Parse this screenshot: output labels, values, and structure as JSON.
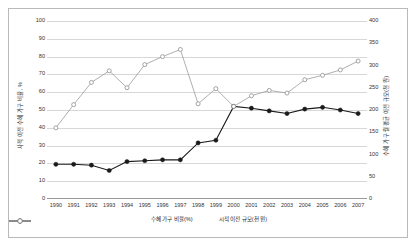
{
  "chart_data": {
    "type": "line",
    "title": "",
    "xlabel": "",
    "ylabel_left": "사적 이전 수혜 가구 비율, %",
    "ylabel_right": "수혜 가구 월평균 이전 규모(천 원)",
    "categories": [
      "1990",
      "1991",
      "1992",
      "1993",
      "1994",
      "1995",
      "1996",
      "1997",
      "1998",
      "1999",
      "2000",
      "2001",
      "2002",
      "2003",
      "2004",
      "2005",
      "2006",
      "2007"
    ],
    "ylim_left": [
      0,
      100
    ],
    "ylim_right": [
      0,
      400
    ],
    "yticks_left": [
      0,
      10,
      20,
      30,
      40,
      50,
      60,
      70,
      80,
      90,
      100
    ],
    "yticks_right": [
      0,
      50,
      100,
      150,
      200,
      250,
      300,
      350,
      400
    ],
    "grid": true,
    "legend_position": "bottom",
    "series": [
      {
        "name": "수혜 가구 비율(%)",
        "axis": "left",
        "marker": "filled-circle",
        "color": "#1a1a1a",
        "values": [
          19.5,
          19.5,
          19.0,
          16.0,
          21.0,
          21.5,
          22.0,
          22.0,
          31.5,
          33.0,
          52.0,
          51.0,
          49.5,
          48.0,
          50.5,
          51.5,
          50.0,
          48.0
        ]
      },
      {
        "name": "시적 이전 규모(천 원)",
        "axis": "right",
        "marker": "open-circle",
        "color": "#9a9a9a",
        "values": [
          160,
          212,
          262,
          288,
          250,
          302,
          320,
          336,
          214,
          248,
          208,
          232,
          244,
          238,
          268,
          278,
          290,
          310
        ]
      }
    ]
  },
  "legend": {
    "items": [
      {
        "label": "수혜 가구 비율(%)"
      },
      {
        "label": "시적 이전 규모(천 원)"
      }
    ]
  }
}
